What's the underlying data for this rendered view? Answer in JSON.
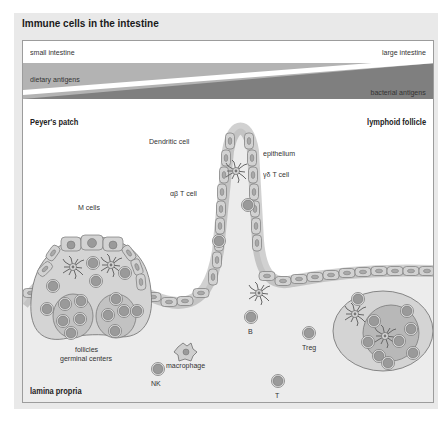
{
  "figure": {
    "title": "Immune cells in the intestine"
  },
  "gradient_bar": {
    "left_label": "small intestine",
    "right_label": "large intestine",
    "upper_band_label": "dietary antigens",
    "lower_band_label": "bacterial antigens",
    "colors": {
      "upper_band": "#b3b3b3",
      "lower_band": "#7f7f7f",
      "divider": "#ffffff"
    }
  },
  "regions": {
    "left": "Peyer's patch",
    "right": "lymphoid follicle",
    "bottom_left": "lamina propria"
  },
  "labels": {
    "dendritic_cell": "Dendritic cell",
    "epithelium": "epithelium",
    "gd_t_cell": "γδ T cell",
    "ab_t_cell": "αβ T cell",
    "m_cells": "M cells",
    "follicles": "follicles",
    "germinal_centers": "germinal centers",
    "b": "B",
    "treg": "Treg",
    "macrophage": "macrophage",
    "nk": "NK",
    "t": "T"
  },
  "colors": {
    "panel_bg": "#e9e9e9",
    "tissue_fill": "#ececec",
    "epithelial_cell": "#d2d2d2",
    "cell_outline": "#7a7a7a",
    "lymphocyte": "#9a9a9a",
    "follicle": "#c8c8c8",
    "germinal_center": "#b4b4b4"
  }
}
